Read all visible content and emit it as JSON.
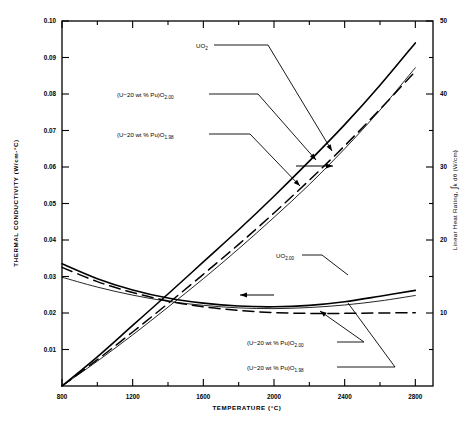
{
  "chart_data": {
    "type": "line",
    "title": "",
    "xlabel": "TEMPERATURE (°C)",
    "ylabel": "THERMAL CONDUCTIVITY (W/cm-°C)",
    "y2label": "Linear Heat Rating, ∫k dθ (W/cm)",
    "xlim": [
      800,
      2900
    ],
    "ylim": [
      0,
      0.1
    ],
    "y2lim": [
      0,
      50
    ],
    "xticks": [
      800,
      1200,
      1600,
      2000,
      2400,
      2800
    ],
    "xticks_minor": [
      1000,
      1400,
      1800,
      2200,
      2600
    ],
    "yticks": [
      0.01,
      0.02,
      0.03,
      0.04,
      0.05,
      0.06,
      0.07,
      0.08,
      0.09,
      0.1
    ],
    "ytick_labels": [
      "0.01",
      "0.02",
      "0.03",
      "0.04",
      "0.05",
      "0.06",
      "0.07",
      "0.08",
      "0.09",
      "0.10"
    ],
    "y2ticks": [
      10,
      20,
      30,
      40,
      50
    ],
    "y2ticks_minor": [
      5,
      15,
      25,
      35,
      45
    ],
    "grid": false,
    "legend_position": "inline-annotations",
    "series": [
      {
        "name": "UO2 — linear heat rating",
        "axis": "y2",
        "style": "solid",
        "x": [
          800,
          1000,
          1200,
          1400,
          1600,
          1800,
          2000,
          2200,
          2400,
          2600,
          2800
        ],
        "values": [
          0.0,
          4.0,
          8.3,
          12.6,
          17.0,
          21.4,
          26.0,
          30.8,
          35.8,
          41.2,
          47.0
        ]
      },
      {
        "name": "(U-20 wt % Pu)O2.00 — linear heat rating",
        "axis": "y2",
        "style": "dashed",
        "x": [
          800,
          1000,
          1200,
          1400,
          1600,
          1800,
          2000,
          2200,
          2400,
          2600,
          2800
        ],
        "values": [
          0.0,
          3.6,
          7.4,
          11.3,
          15.3,
          19.4,
          23.7,
          28.2,
          32.9,
          37.9,
          43.1
        ]
      },
      {
        "name": "(U-20 wt % Pu)O1.98 — linear heat rating",
        "axis": "y2",
        "style": "thin-solid",
        "x": [
          800,
          1000,
          1200,
          1400,
          1600,
          1800,
          2000,
          2200,
          2400,
          2600,
          2800
        ],
        "values": [
          0.0,
          3.4,
          7.0,
          10.8,
          14.7,
          18.8,
          23.1,
          27.6,
          32.5,
          37.8,
          43.6
        ]
      },
      {
        "name": "UO2.00 — thermal conductivity",
        "axis": "y",
        "style": "solid",
        "x": [
          800,
          1000,
          1200,
          1400,
          1600,
          1800,
          2000,
          2200,
          2400,
          2600,
          2800
        ],
        "values": [
          0.0335,
          0.0294,
          0.0263,
          0.0241,
          0.0227,
          0.0219,
          0.0217,
          0.0221,
          0.0231,
          0.0246,
          0.0262
        ]
      },
      {
        "name": "(U-20 wt % Pu)O2.00 — thermal conductivity",
        "axis": "y",
        "style": "dashed",
        "x": [
          800,
          1000,
          1200,
          1400,
          1600,
          1800,
          2000,
          2200,
          2400,
          2600,
          2800
        ],
        "values": [
          0.0325,
          0.0286,
          0.0256,
          0.0233,
          0.0217,
          0.0207,
          0.0201,
          0.0199,
          0.0199,
          0.02,
          0.0201
        ]
      },
      {
        "name": "(U-20 wt % Pu)O1.98 — thermal conductivity",
        "axis": "y",
        "style": "thin-solid",
        "x": [
          800,
          1000,
          1200,
          1400,
          1600,
          1800,
          2000,
          2200,
          2400,
          2600,
          2800
        ],
        "values": [
          0.0298,
          0.0271,
          0.0249,
          0.0232,
          0.0221,
          0.0214,
          0.0212,
          0.0215,
          0.0222,
          0.0233,
          0.0248
        ]
      }
    ],
    "annotations": [
      {
        "id": "uo2-upper",
        "text": "UO",
        "sub": "2",
        "x": 196,
        "y": 48
      },
      {
        "id": "pu200-upper",
        "text": "(U−20 wt % Pu)O",
        "sub": "2.00",
        "x": 117,
        "y": 97
      },
      {
        "id": "pu198-upper",
        "text": "(U−20 wt % Pu)O",
        "sub": "1.98",
        "x": 117,
        "y": 137
      },
      {
        "id": "uo200-lower",
        "text": "UO",
        "sub": "2.00",
        "x": 276,
        "y": 258
      },
      {
        "id": "pu200-lower",
        "text": "(U−20 wt % Pu)O",
        "sub": "2.00",
        "x": 247,
        "y": 345
      },
      {
        "id": "pu198-lower",
        "text": "(U−20 wt % Pu)O",
        "sub": "1.98",
        "x": 247,
        "y": 370
      }
    ],
    "axis_arrows": [
      {
        "id": "right-axis-arrow",
        "direction": "right",
        "x1": 296,
        "y1": 166,
        "x2": 333,
        "y2": 166
      },
      {
        "id": "left-axis-arrow",
        "direction": "left",
        "x1": 274,
        "y1": 295,
        "x2": 240,
        "y2": 295
      }
    ]
  },
  "axes": {
    "x_title": "TEMPERATURE (°C)",
    "y_title": "THERMAL CONDUCTIVITY (W/cm-°C)",
    "y2_title_parts": {
      "pre": "Linear Heat Rating, ",
      "integral": "∫",
      "mid": "k dθ ",
      "unit": "(W/cm)"
    },
    "x_tick_labels": [
      "800",
      "1200",
      "1600",
      "2000",
      "2400",
      "2800"
    ],
    "y_tick_labels": [
      "0.01",
      "0.02",
      "0.03",
      "0.04",
      "0.05",
      "0.06",
      "0.07",
      "0.08",
      "0.09",
      "0.10"
    ],
    "y2_tick_labels": [
      "10",
      "20",
      "30",
      "40",
      "50"
    ]
  }
}
